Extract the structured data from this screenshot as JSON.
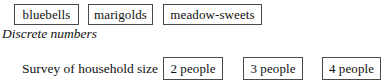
{
  "document": {
    "continuous_row": {
      "items": [
        {
          "label": "bluebells"
        },
        {
          "label": "marigolds"
        },
        {
          "label": "meadow-sweets"
        }
      ]
    },
    "section_heading": "Discrete numbers",
    "discrete_row": {
      "label": "Survey of household size",
      "items": [
        {
          "label": "2 people"
        },
        {
          "label": "3 people"
        },
        {
          "label": "4 people"
        }
      ]
    }
  },
  "style": {
    "box_border_color": "#4a4a4a",
    "text_color": "#111111",
    "background_color": "#ffffff"
  }
}
